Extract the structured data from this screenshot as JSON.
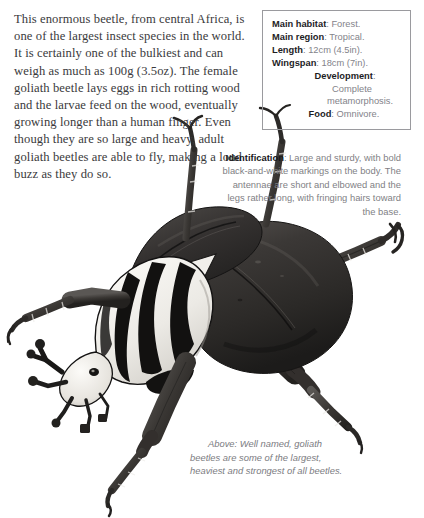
{
  "article": {
    "text": "This enormous beetle, from central Africa, is one of the largest insect species in the world. It is certainly one of the bulkiest and can weigh as much as 100g (3.5oz). The female goliath beetle lays eggs in rich rotting wood and the larvae feed on the wood, eventually growing longer than a human finger. Even though they are so large and heavy, adult goliath beetles are able to fly, making a loud buzz as they do so."
  },
  "fact_box": {
    "rows": [
      {
        "label": "Main habitat",
        "value": ": Forest."
      },
      {
        "label": "Main region",
        "value": ": Tropical."
      },
      {
        "label": "Length",
        "value": ": 12cm (4.5in)."
      },
      {
        "label": "Wingspan",
        "value": ": 18cm (7in)."
      },
      {
        "label": "Development",
        "value": ":"
      },
      {
        "label": "",
        "value": "Complete"
      },
      {
        "label": "",
        "value": "metamorphosis."
      },
      {
        "label": "Food",
        "value": ": Omnivore."
      }
    ]
  },
  "identification": {
    "label": "Identification",
    "text": ": Large and sturdy, with bold black-and-white markings on the body. The antennae are short and elbowed and the legs rather long, with fringing hairs toward the base."
  },
  "caption": {
    "text": "Above: Well named, goliath beetles are some of the largest, heaviest and strongest of all beetles."
  },
  "illustration": {
    "subject": "goliath-beetle",
    "colors": {
      "elytra_dark": "#2e2c2b",
      "elytra_mid": "#4a4745",
      "pronotum_white": "#f4f2ee",
      "pronotum_stripe": "#1b1a19",
      "leg_dark": "#35322f",
      "background": "#ffffff"
    }
  }
}
